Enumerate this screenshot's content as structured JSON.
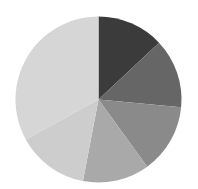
{
  "chart_data": {
    "type": "pie",
    "title": "",
    "categories": [
      "Slice 1",
      "Slice 2",
      "Slice 3",
      "Slice 4",
      "Slice 5",
      "Slice 6"
    ],
    "values": [
      13,
      13.5,
      13.5,
      13,
      14,
      33
    ],
    "colors": [
      "#3b3b3b",
      "#666666",
      "#8a8a8a",
      "#a9a9a9",
      "#cdcdcd",
      "#d6d6d6"
    ],
    "start_angle_deg": 0,
    "direction": "clockwise",
    "legend": "none",
    "labels_visible": false,
    "center": [
      98.5,
      99.5
    ],
    "radius": 83
  }
}
